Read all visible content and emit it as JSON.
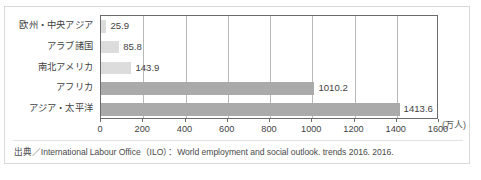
{
  "chart_data": {
    "type": "bar",
    "orientation": "horizontal",
    "title": "",
    "xlabel": "",
    "ylabel": "",
    "unit_label": "(万人)",
    "categories": [
      "欧州・中央アジア",
      "アラブ諸国",
      "南北アメリカ",
      "アフリカ",
      "アジア・太平洋"
    ],
    "values": [
      25.9,
      85.8,
      143.9,
      1010.2,
      1413.6
    ],
    "value_labels": [
      "25.9",
      "85.8",
      "143.9",
      "1010.2",
      "1413.6"
    ],
    "bar_colors": [
      "#dcdcdc",
      "#dcdcdc",
      "#dcdcdc",
      "#aaaaaa",
      "#aaaaaa"
    ],
    "xlim": [
      0,
      1600
    ],
    "xticks": [
      0,
      200,
      400,
      600,
      800,
      1000,
      1200,
      1400,
      1600
    ],
    "xtick_labels": [
      "0",
      "200",
      "400",
      "600",
      "800",
      "1000",
      "1200",
      "1400",
      "1600"
    ],
    "grid": true,
    "grid_axis": "x",
    "legend": null
  },
  "source": {
    "text": "出典／International Labour Office（ILO）：World employment and social outlook. trends 2016. 2016."
  },
  "colors": {
    "bar_light": "#dcdcdc",
    "bar_dark": "#aaaaaa",
    "axis": "#6b6b6b",
    "grid": "#b9b9b9",
    "frame": "#d9d9d9",
    "text": "#3f3f3f"
  }
}
